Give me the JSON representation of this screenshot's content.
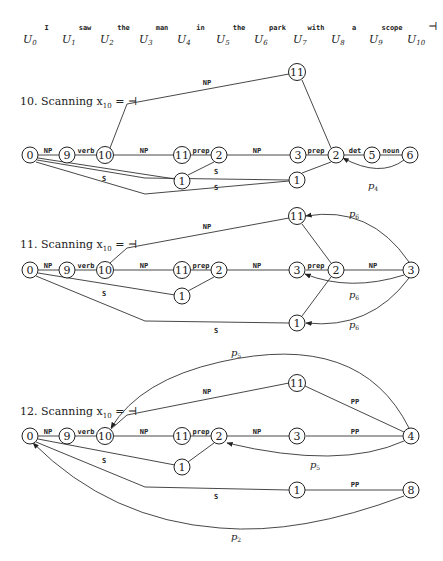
{
  "sentence": {
    "words": [
      "I",
      "saw",
      "the",
      "man",
      "in",
      "the",
      "park",
      "with",
      "a",
      "scope",
      "⊣"
    ],
    "positions": [
      {
        "var": "U",
        "sub": "0"
      },
      {
        "var": "U",
        "sub": "1"
      },
      {
        "var": "U",
        "sub": "2"
      },
      {
        "var": "U",
        "sub": "3"
      },
      {
        "var": "U",
        "sub": "4"
      },
      {
        "var": "U",
        "sub": "5"
      },
      {
        "var": "U",
        "sub": "6"
      },
      {
        "var": "U",
        "sub": "7"
      },
      {
        "var": "U",
        "sub": "8"
      },
      {
        "var": "U",
        "sub": "9"
      },
      {
        "var": "U",
        "sub": "10"
      }
    ]
  },
  "diagrams": [
    {
      "id": "d10",
      "title": {
        "prefix": "10. Scanning x",
        "sub": "10",
        "suffix": " = ⊣"
      },
      "nodes": [
        {
          "id": "n0",
          "label": "0"
        },
        {
          "id": "n9",
          "label": "9"
        },
        {
          "id": "n10",
          "label": "10"
        },
        {
          "id": "n11a",
          "label": "11"
        },
        {
          "id": "n2a",
          "label": "2"
        },
        {
          "id": "n3",
          "label": "3"
        },
        {
          "id": "n2b",
          "label": "2"
        },
        {
          "id": "n5",
          "label": "5"
        },
        {
          "id": "n6",
          "label": "6"
        },
        {
          "id": "n11t",
          "label": "11"
        },
        {
          "id": "n1a",
          "label": "1"
        },
        {
          "id": "n1b",
          "label": "1"
        }
      ],
      "edges": [
        {
          "label": "NP"
        },
        {
          "label": "verb"
        },
        {
          "label": "NP"
        },
        {
          "label": "prep"
        },
        {
          "label": "NP"
        },
        {
          "label": "prep"
        },
        {
          "label": "det"
        },
        {
          "label": "noun"
        },
        {
          "label": "NP"
        },
        {
          "label": "S"
        },
        {
          "label": "S"
        },
        {
          "label": "S"
        }
      ],
      "pointers": [
        {
          "var": "p",
          "sub": "4"
        }
      ]
    },
    {
      "id": "d11",
      "title": {
        "prefix": "11. Scanning x",
        "sub": "10",
        "suffix": " = ⊣"
      },
      "nodes": [
        {
          "id": "n0",
          "label": "0"
        },
        {
          "id": "n9",
          "label": "9"
        },
        {
          "id": "n10",
          "label": "10"
        },
        {
          "id": "n11a",
          "label": "11"
        },
        {
          "id": "n2a",
          "label": "2"
        },
        {
          "id": "n3",
          "label": "3"
        },
        {
          "id": "n2b",
          "label": "2"
        },
        {
          "id": "n3r",
          "label": "3"
        },
        {
          "id": "n11t",
          "label": "11"
        },
        {
          "id": "n1a",
          "label": "1"
        },
        {
          "id": "n1b",
          "label": "1"
        }
      ],
      "edges": [
        {
          "label": "NP"
        },
        {
          "label": "verb"
        },
        {
          "label": "NP"
        },
        {
          "label": "prep"
        },
        {
          "label": "NP"
        },
        {
          "label": "prep"
        },
        {
          "label": "NP"
        },
        {
          "label": "NP"
        },
        {
          "label": "S"
        },
        {
          "label": "S"
        }
      ],
      "pointers": [
        {
          "var": "p",
          "sub": "6"
        },
        {
          "var": "p",
          "sub": "6"
        },
        {
          "var": "p",
          "sub": "6"
        }
      ]
    },
    {
      "id": "d12",
      "title": {
        "prefix": "12. Scanning x",
        "sub": "10",
        "suffix": " = ⊣"
      },
      "nodes": [
        {
          "id": "n0",
          "label": "0"
        },
        {
          "id": "n9",
          "label": "9"
        },
        {
          "id": "n10",
          "label": "10"
        },
        {
          "id": "n11a",
          "label": "11"
        },
        {
          "id": "n2a",
          "label": "2"
        },
        {
          "id": "n3",
          "label": "3"
        },
        {
          "id": "n4",
          "label": "4"
        },
        {
          "id": "n11t",
          "label": "11"
        },
        {
          "id": "n1a",
          "label": "1"
        },
        {
          "id": "n1b",
          "label": "1"
        },
        {
          "id": "n8",
          "label": "8"
        }
      ],
      "edges": [
        {
          "label": "NP"
        },
        {
          "label": "verb"
        },
        {
          "label": "NP"
        },
        {
          "label": "prep"
        },
        {
          "label": "NP"
        },
        {
          "label": "PP"
        },
        {
          "label": "NP"
        },
        {
          "label": "PP"
        },
        {
          "label": "S"
        },
        {
          "label": "S"
        },
        {
          "label": "PP"
        }
      ],
      "pointers": [
        {
          "var": "p",
          "sub": "5"
        },
        {
          "var": "p",
          "sub": "5"
        },
        {
          "var": "p",
          "sub": "2"
        }
      ]
    }
  ]
}
